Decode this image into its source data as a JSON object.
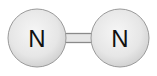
{
  "diagram": {
    "molecule": "N2",
    "atoms": [
      {
        "id": "atom-1",
        "symbol": "N",
        "cx": 37,
        "cy": 38,
        "r": 29
      },
      {
        "id": "atom-2",
        "symbol": "N",
        "cx": 120,
        "cy": 38,
        "r": 29
      }
    ],
    "bonds": [
      {
        "from": "atom-1",
        "to": "atom-2",
        "order": 2
      }
    ],
    "colors": {
      "atom_fill_center": "#f4f4f4",
      "atom_fill_edge": "#d4d4d4",
      "atom_stroke": "#9a9a9a",
      "bond_stroke": "#8a8a8a",
      "bond_fill": "#e2e2e2"
    }
  }
}
